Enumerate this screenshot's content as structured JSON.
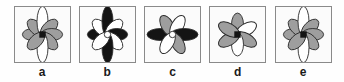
{
  "figure": {
    "type": "multiple-choice-figure-panels",
    "background_color": "#fefefe",
    "panel_border_color": "#8a8a8a",
    "panel_fill_color": "#fbfbfb",
    "colors": {
      "gray_petal": "#9e9e9e",
      "black_petal": "#141414",
      "white_petal": "#ffffff",
      "outline": "#2b2b2b",
      "label_text": "#1a1a1a"
    }
  },
  "panels": [
    {
      "label": "a",
      "name": "flower-a",
      "petal_count": 8,
      "center_shape": "square",
      "center_color": "#141414",
      "description": "Eight elliptical petals radiating at 45 degree steps; six gray petals with the vertical pair white.",
      "petals": [
        {
          "angle": 0,
          "fill": "#9e9e9e",
          "rx": 6,
          "ry": 15
        },
        {
          "angle": 45,
          "fill": "#9e9e9e",
          "rx": 6,
          "ry": 15
        },
        {
          "angle": 90,
          "fill": "#ffffff",
          "rx": 5.5,
          "ry": 21
        },
        {
          "angle": 135,
          "fill": "#9e9e9e",
          "rx": 6,
          "ry": 15
        },
        {
          "angle": 180,
          "fill": "#9e9e9e",
          "rx": 6,
          "ry": 15
        },
        {
          "angle": 225,
          "fill": "#9e9e9e",
          "rx": 6,
          "ry": 15
        },
        {
          "angle": 270,
          "fill": "#ffffff",
          "rx": 5.5,
          "ry": 21
        },
        {
          "angle": 315,
          "fill": "#9e9e9e",
          "rx": 6,
          "ry": 15
        }
      ]
    },
    {
      "label": "b",
      "name": "flower-b",
      "petal_count": 8,
      "center_shape": "circle",
      "center_color": "#ffffff",
      "description": "Eight petals; vertical pair long and black, horizontal pair black, diagonals white.",
      "petals": [
        {
          "angle": 0,
          "fill": "#141414",
          "rx": 6,
          "ry": 15
        },
        {
          "angle": 45,
          "fill": "#ffffff",
          "rx": 6,
          "ry": 15
        },
        {
          "angle": 90,
          "fill": "#141414",
          "rx": 5.5,
          "ry": 21
        },
        {
          "angle": 135,
          "fill": "#ffffff",
          "rx": 6,
          "ry": 15
        },
        {
          "angle": 180,
          "fill": "#141414",
          "rx": 6,
          "ry": 15
        },
        {
          "angle": 225,
          "fill": "#ffffff",
          "rx": 6,
          "ry": 15
        },
        {
          "angle": 270,
          "fill": "#141414",
          "rx": 5.5,
          "ry": 21
        },
        {
          "angle": 315,
          "fill": "#ffffff",
          "rx": 6,
          "ry": 15
        }
      ]
    },
    {
      "label": "c",
      "name": "flower-c",
      "petal_count": 6,
      "center_shape": "circle",
      "center_color": "#ffffff",
      "description": "Six petals; horizontal pair black and elongated, two gray diagonals and two white diagonals.",
      "petals": [
        {
          "angle": 0,
          "fill": "#141414",
          "rx": 6,
          "ry": 19
        },
        {
          "angle": 60,
          "fill": "#9e9e9e",
          "rx": 6,
          "ry": 16
        },
        {
          "angle": 120,
          "fill": "#ffffff",
          "rx": 6,
          "ry": 16
        },
        {
          "angle": 180,
          "fill": "#141414",
          "rx": 6,
          "ry": 19
        },
        {
          "angle": 240,
          "fill": "#9e9e9e",
          "rx": 6,
          "ry": 16
        },
        {
          "angle": 300,
          "fill": "#ffffff",
          "rx": 6,
          "ry": 16
        }
      ]
    },
    {
      "label": "d",
      "name": "flower-d",
      "petal_count": 6,
      "center_shape": "square",
      "center_color": "#141414",
      "description": "Six petals in a star arrangement alternating gray and white, black square center.",
      "petals": [
        {
          "angle": 90,
          "fill": "#9e9e9e",
          "rx": 6,
          "ry": 16
        },
        {
          "angle": 150,
          "fill": "#ffffff",
          "rx": 6,
          "ry": 16
        },
        {
          "angle": 210,
          "fill": "#9e9e9e",
          "rx": 6,
          "ry": 16
        },
        {
          "angle": 270,
          "fill": "#ffffff",
          "rx": 6,
          "ry": 16
        },
        {
          "angle": 330,
          "fill": "#9e9e9e",
          "rx": 6,
          "ry": 16
        },
        {
          "angle": 30,
          "fill": "#9e9e9e",
          "rx": 6,
          "ry": 16
        }
      ]
    },
    {
      "label": "e",
      "name": "flower-e",
      "petal_count": 8,
      "center_shape": "square",
      "center_color": "#141414",
      "description": "Eight elliptical petals; six gray with the vertical pair white and elongated.",
      "petals": [
        {
          "angle": 0,
          "fill": "#9e9e9e",
          "rx": 6,
          "ry": 15
        },
        {
          "angle": 45,
          "fill": "#9e9e9e",
          "rx": 6,
          "ry": 15
        },
        {
          "angle": 90,
          "fill": "#ffffff",
          "rx": 5.5,
          "ry": 21
        },
        {
          "angle": 135,
          "fill": "#9e9e9e",
          "rx": 6,
          "ry": 15
        },
        {
          "angle": 180,
          "fill": "#9e9e9e",
          "rx": 6,
          "ry": 15
        },
        {
          "angle": 225,
          "fill": "#9e9e9e",
          "rx": 6,
          "ry": 15
        },
        {
          "angle": 270,
          "fill": "#ffffff",
          "rx": 5.5,
          "ry": 21
        },
        {
          "angle": 315,
          "fill": "#9e9e9e",
          "rx": 6,
          "ry": 15
        }
      ]
    }
  ]
}
